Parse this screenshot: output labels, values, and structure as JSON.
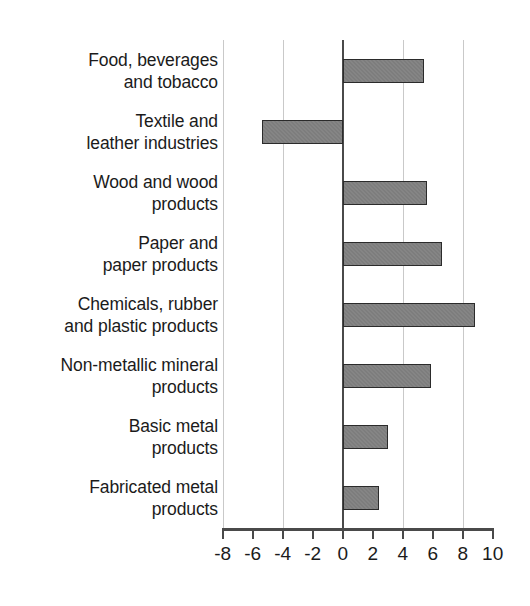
{
  "chart_data": {
    "type": "bar",
    "orientation": "horizontal",
    "title": "",
    "xlabel": "",
    "ylabel": "",
    "xlim": [
      -8,
      10
    ],
    "grid": true,
    "legend": "none",
    "tick_labels": [
      "-8",
      "-6",
      "-4",
      "-2",
      "0",
      "2",
      "4",
      "6",
      "8",
      "10"
    ],
    "tick_values": [
      -8,
      -6,
      -4,
      -2,
      0,
      2,
      4,
      6,
      8,
      10
    ],
    "gridline_values": [
      -8,
      -4,
      0,
      4,
      8
    ],
    "categories": [
      "Food, beverages\nand tobacco",
      "Textile and\nleather industries",
      "Wood and wood\nproducts",
      "Paper and\npaper products",
      "Chemicals, rubber\nand plastic products",
      "Non-metallic mineral\nproducts",
      "Basic metal\nproducts",
      "Fabricated metal\nproducts"
    ],
    "values": [
      5.4,
      -5.4,
      5.6,
      6.6,
      8.8,
      5.9,
      3.0,
      2.4
    ],
    "bar_fill_color": "#7d7d7d",
    "bar_edge_color": "#2b2b2b",
    "grid_color": "#c9c9c9",
    "axis_color": "#4a4a4a"
  }
}
